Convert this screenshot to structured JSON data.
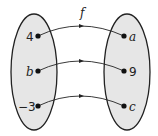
{
  "function_label": "f",
  "domain": [
    "4",
    "b",
    "−3"
  ],
  "codomain": [
    "a",
    "9",
    "c"
  ],
  "colors": {
    "set_fill": "#e6e6e6",
    "stroke": "#222222"
  }
}
